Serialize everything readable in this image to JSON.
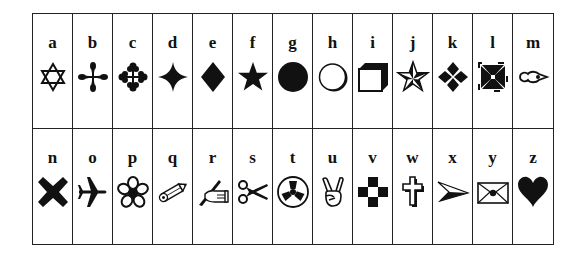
{
  "table": {
    "rows": [
      [
        {
          "letter": "a",
          "icon": "star-of-david-icon"
        },
        {
          "letter": "b",
          "icon": "four-petal-cross-icon"
        },
        {
          "letter": "c",
          "icon": "trefoil-cross-icon"
        },
        {
          "letter": "d",
          "icon": "four-point-star-icon"
        },
        {
          "letter": "e",
          "icon": "diamond-icon"
        },
        {
          "letter": "f",
          "icon": "star-icon"
        },
        {
          "letter": "g",
          "icon": "filled-circle-icon"
        },
        {
          "letter": "h",
          "icon": "shadowed-circle-icon"
        },
        {
          "letter": "i",
          "icon": "cube-icon"
        },
        {
          "letter": "j",
          "icon": "nautical-star-icon"
        },
        {
          "letter": "k",
          "icon": "four-diamonds-icon"
        },
        {
          "letter": "l",
          "icon": "maltese-cross-icon"
        },
        {
          "letter": "m",
          "icon": "key-hole-pointer-icon"
        }
      ],
      [
        {
          "letter": "n",
          "icon": "heavy-x-icon"
        },
        {
          "letter": "o",
          "icon": "airplane-icon"
        },
        {
          "letter": "p",
          "icon": "flower-icon"
        },
        {
          "letter": "q",
          "icon": "pencil-icon"
        },
        {
          "letter": "r",
          "icon": "writing-hand-icon"
        },
        {
          "letter": "s",
          "icon": "scissors-icon"
        },
        {
          "letter": "t",
          "icon": "propeller-circle-icon"
        },
        {
          "letter": "u",
          "icon": "victory-hand-icon"
        },
        {
          "letter": "v",
          "icon": "checker-cross-icon"
        },
        {
          "letter": "w",
          "icon": "latin-cross-icon"
        },
        {
          "letter": "x",
          "icon": "arrowhead-icon"
        },
        {
          "letter": "y",
          "icon": "envelope-icon"
        },
        {
          "letter": "z",
          "icon": "heart-icon"
        }
      ]
    ]
  },
  "colors": {
    "ink": "#111111",
    "border": "#222222",
    "background": "#ffffff"
  }
}
